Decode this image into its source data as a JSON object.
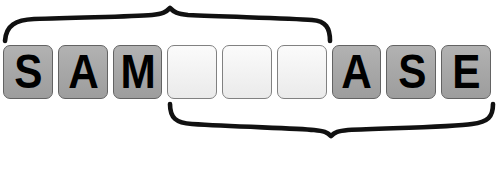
{
  "canvas": {
    "width": 499,
    "height": 189,
    "background": "#ffffff"
  },
  "puzzle": {
    "title": "letter tile word puzzle",
    "tile_count": 9,
    "filled_color": "#a6a6a6",
    "empty_color": "#f1f1f1",
    "letter_color": "#000000",
    "border_color": "#6f6f6f",
    "tiles": [
      {
        "letter": "S",
        "state": "filled"
      },
      {
        "letter": "A",
        "state": "filled"
      },
      {
        "letter": "M",
        "state": "filled"
      },
      {
        "letter": "",
        "state": "empty"
      },
      {
        "letter": "",
        "state": "empty"
      },
      {
        "letter": "",
        "state": "empty"
      },
      {
        "letter": "A",
        "state": "filled"
      },
      {
        "letter": "S",
        "state": "filled"
      },
      {
        "letter": "E",
        "state": "filled"
      }
    ],
    "visible_letters": "SAM___ASE"
  },
  "braces": {
    "stroke_color": "#111111",
    "top": {
      "name": "top-brace",
      "orientation": "points-up",
      "spans_tiles": "1-6",
      "left_x": 4,
      "right_x": 331,
      "apex_x": 170,
      "apex_y": 8,
      "baseline_y": 40,
      "stroke_width": 4.6
    },
    "bottom": {
      "name": "bottom-brace",
      "orientation": "points-down",
      "spans_tiles": "4-9",
      "left_x": 170,
      "right_x": 494,
      "apex_x": 331,
      "apex_y": 136,
      "baseline_y": 104,
      "stroke_width": 4.6
    }
  }
}
